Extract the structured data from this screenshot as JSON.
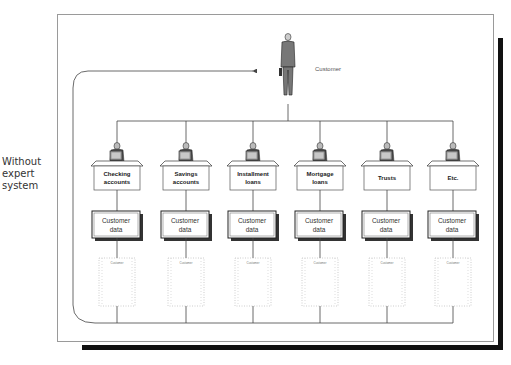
{
  "side_label": [
    "Without",
    "expert",
    "system"
  ],
  "customer": {
    "label": "Customer"
  },
  "departments": [
    {
      "name_line1": "Checking",
      "name_line2": "accounts",
      "data_line1": "Customer",
      "data_line2": "data",
      "printout": "Customer"
    },
    {
      "name_line1": "Savings",
      "name_line2": "accounts",
      "data_line1": "Customer",
      "data_line2": "data",
      "printout": "Customer"
    },
    {
      "name_line1": "Installment",
      "name_line2": "loans",
      "data_line1": "Customer",
      "data_line2": "data",
      "printout": "Customer"
    },
    {
      "name_line1": "Mortgage",
      "name_line2": "loans",
      "data_line1": "Customer",
      "data_line2": "data",
      "printout": "Customer"
    },
    {
      "name_line1": "Trusts",
      "name_line2": "",
      "data_line1": "Customer",
      "data_line2": "data",
      "printout": "Customer"
    },
    {
      "name_line1": "Etc.",
      "name_line2": "",
      "data_line1": "Customer",
      "data_line2": "data",
      "printout": "Customer"
    }
  ],
  "colors": {
    "line": "#444444",
    "frame": "#9a9a9a",
    "shadow": "#111111"
  }
}
